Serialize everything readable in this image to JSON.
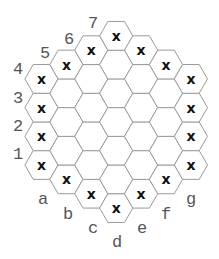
{
  "board": {
    "type": "hex-hexagon",
    "radius": 3,
    "columns": [
      "a",
      "b",
      "c",
      "d",
      "e",
      "f",
      "g"
    ],
    "rows": [
      "1",
      "2",
      "3",
      "4",
      "5",
      "6",
      "7"
    ],
    "column_ranges": {
      "a": [
        1,
        4
      ],
      "b": [
        1,
        5
      ],
      "c": [
        1,
        6
      ],
      "d": [
        1,
        7
      ],
      "e": [
        2,
        7
      ],
      "f": [
        3,
        7
      ],
      "g": [
        4,
        7
      ]
    },
    "marks": [
      {
        "cell": "a1",
        "symbol": "x"
      },
      {
        "cell": "a2",
        "symbol": "x"
      },
      {
        "cell": "a3",
        "symbol": "x"
      },
      {
        "cell": "a4",
        "symbol": "x"
      },
      {
        "cell": "b5",
        "symbol": "x"
      },
      {
        "cell": "c6",
        "symbol": "x"
      },
      {
        "cell": "d7",
        "symbol": "x"
      },
      {
        "cell": "e7",
        "symbol": "x"
      },
      {
        "cell": "f7",
        "symbol": "x"
      },
      {
        "cell": "g7",
        "symbol": "x"
      },
      {
        "cell": "g6",
        "symbol": "x"
      },
      {
        "cell": "g5",
        "symbol": "x"
      },
      {
        "cell": "g4",
        "symbol": "x"
      },
      {
        "cell": "f3",
        "symbol": "x"
      },
      {
        "cell": "e2",
        "symbol": "x"
      },
      {
        "cell": "d1",
        "symbol": "x"
      },
      {
        "cell": "c1",
        "symbol": "x"
      },
      {
        "cell": "b1",
        "symbol": "x"
      }
    ],
    "row_labels": [
      {
        "text": "1",
        "x": 18,
        "y": 159
      },
      {
        "text": "2",
        "x": 18,
        "y": 131
      },
      {
        "text": "3",
        "x": 18,
        "y": 103
      },
      {
        "text": "4",
        "x": 18,
        "y": 74
      },
      {
        "text": "5",
        "x": 45,
        "y": 58
      },
      {
        "text": "6",
        "x": 69,
        "y": 44
      },
      {
        "text": "7",
        "x": 93,
        "y": 28
      }
    ],
    "col_labels": [
      {
        "text": "a",
        "x": 43,
        "y": 204
      },
      {
        "text": "b",
        "x": 68,
        "y": 219
      },
      {
        "text": "c",
        "x": 93,
        "y": 233
      },
      {
        "text": "d",
        "x": 117,
        "y": 247
      },
      {
        "text": "e",
        "x": 142,
        "y": 233
      },
      {
        "text": "f",
        "x": 166,
        "y": 219
      },
      {
        "text": "g",
        "x": 191,
        "y": 204
      }
    ],
    "colors": {
      "cell_stroke": "#9a9a9a",
      "mark": "#111111",
      "label": "#555555"
    }
  }
}
